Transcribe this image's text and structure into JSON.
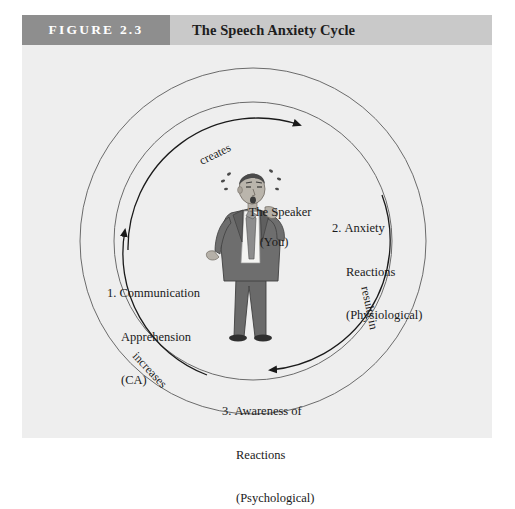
{
  "figure": {
    "number_label": "FIGURE 2.3",
    "title": "The Speech Anxiety Cycle"
  },
  "diagram": {
    "center": {
      "line1": "The Speaker",
      "line2": "(You)"
    },
    "nodes": [
      {
        "id": "communication-apprehension",
        "number": "1.",
        "line1": "Communication",
        "line2": "Apprehension",
        "line3": "(CA)"
      },
      {
        "id": "anxiety-reactions",
        "number": "2.",
        "line1": "Anxiety",
        "line2": "Reactions",
        "line3": "(Physiological)"
      },
      {
        "id": "awareness-of-reactions",
        "number": "3.",
        "line1": "Awareness of",
        "line2": "Reactions",
        "line3": "(Psychological)"
      }
    ],
    "arrows": [
      {
        "id": "creates",
        "label": "creates"
      },
      {
        "id": "results-in",
        "label": "results in"
      },
      {
        "id": "increases",
        "label": "increases"
      }
    ],
    "illustration": {
      "name": "anxious-speaker-illustration",
      "description": "Man in gray suit and tie sweating"
    }
  },
  "colors": {
    "panel_background": "#eeeeee",
    "header_bar": "#c9c9c9",
    "figure_number_box": "#8e8e8e",
    "figure_number_text": "#ffffff",
    "title_text": "#1d1d1d",
    "diagram_line": "#555555",
    "suit": "#6e6e6e",
    "skin": "#b5b0a8"
  }
}
